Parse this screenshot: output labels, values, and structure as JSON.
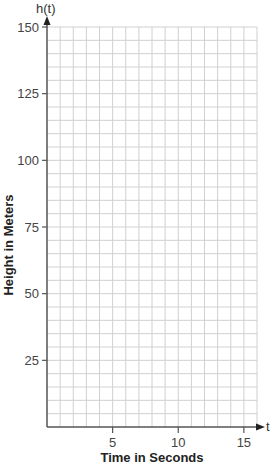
{
  "chart_data": {
    "type": "line",
    "title": "",
    "xlabel": "Time in Seconds",
    "ylabel": "Height in Meters",
    "x_axis_name": "t",
    "y_axis_name": "h(t)",
    "xlim": [
      0,
      16
    ],
    "ylim": [
      0,
      150
    ],
    "x_ticks": [
      5,
      10,
      15
    ],
    "x_tick_labels": [
      "5",
      "10",
      "15"
    ],
    "y_ticks": [
      25,
      50,
      75,
      100,
      125,
      150
    ],
    "y_tick_labels": [
      "25",
      "50",
      "75",
      "100",
      "125",
      "150"
    ],
    "grid": true,
    "grid_x_step": 1,
    "grid_y_step": 5,
    "series": [],
    "legend": null
  },
  "colors": {
    "grid": "#d0d0d0",
    "axis": "#555555",
    "text": "#333333"
  }
}
